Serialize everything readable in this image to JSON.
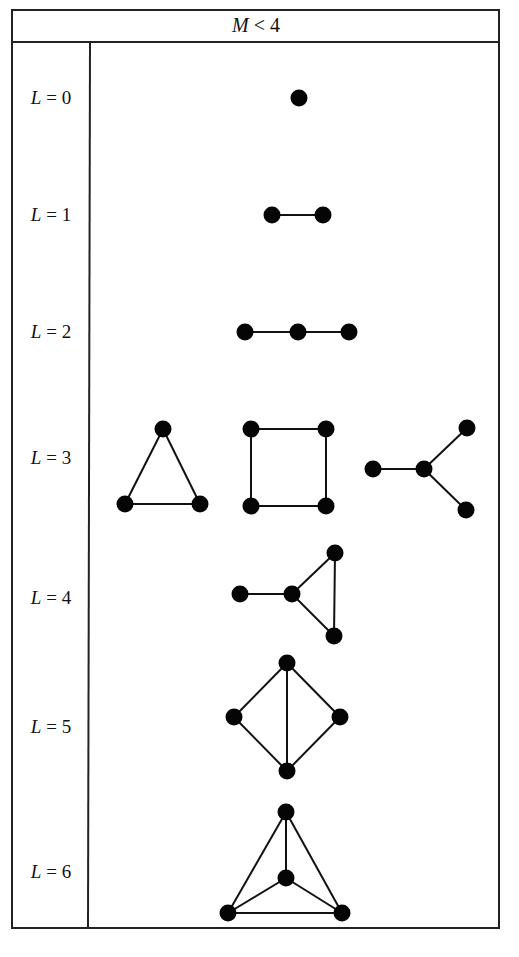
{
  "header": {
    "title_var": "M",
    "title_rest": " < 4"
  },
  "rows": [
    {
      "label_var": "L",
      "label_rest": " = 0",
      "y": 98,
      "graphs": [
        {
          "nodes": [
            [
              299,
              98
            ]
          ],
          "edges": []
        }
      ]
    },
    {
      "label_var": "L",
      "label_rest": " = 1",
      "y": 215,
      "graphs": [
        {
          "nodes": [
            [
              272,
              215
            ],
            [
              323,
              215
            ]
          ],
          "edges": [
            [
              0,
              1
            ]
          ]
        }
      ]
    },
    {
      "label_var": "L",
      "label_rest": " = 2",
      "y": 332,
      "graphs": [
        {
          "nodes": [
            [
              245,
              332
            ],
            [
              298,
              332
            ],
            [
              349,
              332
            ]
          ],
          "edges": [
            [
              0,
              1
            ],
            [
              1,
              2
            ]
          ]
        }
      ]
    },
    {
      "label_var": "L",
      "label_rest": " = 3",
      "y": 458,
      "graphs": [
        {
          "nodes": [
            [
              163,
              429
            ],
            [
              125,
              504
            ],
            [
              200,
              504
            ]
          ],
          "edges": [
            [
              0,
              1
            ],
            [
              0,
              2
            ],
            [
              1,
              2
            ]
          ]
        },
        {
          "nodes": [
            [
              251,
              429
            ],
            [
              326,
              429
            ],
            [
              251,
              506
            ],
            [
              326,
              506
            ]
          ],
          "edges": [
            [
              0,
              1
            ],
            [
              0,
              2
            ],
            [
              1,
              3
            ],
            [
              2,
              3
            ]
          ]
        },
        {
          "nodes": [
            [
              373,
              469
            ],
            [
              424,
              469
            ],
            [
              467,
              428
            ],
            [
              466,
              510
            ]
          ],
          "edges": [
            [
              0,
              1
            ],
            [
              1,
              2
            ],
            [
              1,
              3
            ]
          ]
        }
      ]
    },
    {
      "label_var": "L",
      "label_rest": " = 4",
      "y": 598,
      "graphs": [
        {
          "nodes": [
            [
              240,
              594
            ],
            [
              292,
              594
            ],
            [
              335,
              553
            ],
            [
              334,
              636
            ]
          ],
          "edges": [
            [
              0,
              1
            ],
            [
              1,
              2
            ],
            [
              1,
              3
            ],
            [
              2,
              3
            ]
          ]
        }
      ]
    },
    {
      "label_var": "L",
      "label_rest": " = 5",
      "y": 727,
      "graphs": [
        {
          "nodes": [
            [
              287,
              663
            ],
            [
              234,
              717
            ],
            [
              340,
              717
            ],
            [
              287,
              771
            ]
          ],
          "edges": [
            [
              0,
              1
            ],
            [
              0,
              2
            ],
            [
              1,
              3
            ],
            [
              2,
              3
            ],
            [
              0,
              3
            ]
          ]
        }
      ]
    },
    {
      "label_var": "L",
      "label_rest": " = 6",
      "y": 872,
      "graphs": [
        {
          "nodes": [
            [
              286,
              812
            ],
            [
              286,
              878
            ],
            [
              228,
              913
            ],
            [
              342,
              913
            ]
          ],
          "edges": [
            [
              0,
              1
            ],
            [
              0,
              2
            ],
            [
              0,
              3
            ],
            [
              1,
              2
            ],
            [
              1,
              3
            ],
            [
              2,
              3
            ]
          ]
        }
      ]
    }
  ]
}
